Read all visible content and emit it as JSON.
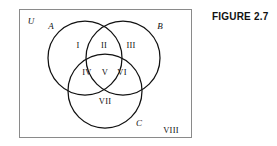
{
  "figure": {
    "caption": "FIGURE 2.7",
    "type": "venn-diagram",
    "set_count": 3
  },
  "diagram": {
    "universe_label": "U",
    "outside_region_label": "VIII",
    "border_color": "#8a8a8a",
    "stroke_color": "#111111",
    "background_color": "#ffffff",
    "sets": [
      {
        "name": "A",
        "label": "A",
        "cx": 85,
        "cy": 58,
        "r": 37
      },
      {
        "name": "B",
        "label": "B",
        "cx": 123,
        "cy": 58,
        "r": 37
      },
      {
        "name": "C",
        "label": "C",
        "cx": 105,
        "cy": 91,
        "r": 37
      }
    ],
    "regions": [
      {
        "id": "I",
        "label": "I",
        "meaning": "A only"
      },
      {
        "id": "II",
        "label": "II",
        "meaning": "A and B only"
      },
      {
        "id": "III",
        "label": "III",
        "meaning": "B only"
      },
      {
        "id": "IV",
        "label": "IV",
        "meaning": "A and C only"
      },
      {
        "id": "V",
        "label": "V",
        "meaning": "A and B and C"
      },
      {
        "id": "VI",
        "label": "VI",
        "meaning": "B and C only"
      },
      {
        "id": "VII",
        "label": "VII",
        "meaning": "C only"
      },
      {
        "id": "VIII",
        "label": "VIII",
        "meaning": "outside all sets"
      }
    ]
  }
}
